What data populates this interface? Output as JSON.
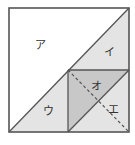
{
  "diagram": {
    "type": "geometry-square-partition",
    "outer_square": {
      "x1": 9,
      "y1": 8,
      "x2": 129,
      "y2": 132
    },
    "inner_square": {
      "x1": 68,
      "y1": 70,
      "x2": 129,
      "y2": 132
    },
    "colors": {
      "background": "#ffffff",
      "stroke": "#555555",
      "region_white": "#ffffff",
      "region_light": "#e4e4e4",
      "region_mid": "#c8c8c8",
      "dashed": "#555555"
    },
    "regions": [
      {
        "id": "a",
        "label": "ア",
        "fill": "white"
      },
      {
        "id": "i",
        "label": "イ",
        "fill": "light"
      },
      {
        "id": "u",
        "label": "ウ",
        "fill": "light"
      },
      {
        "id": "o",
        "label": "オ",
        "fill": "mid"
      },
      {
        "id": "e",
        "label": "エ",
        "fill": "light"
      }
    ],
    "labels": {
      "a": "ア",
      "i": "イ",
      "u": "ウ",
      "o": "オ",
      "e": "エ"
    }
  }
}
